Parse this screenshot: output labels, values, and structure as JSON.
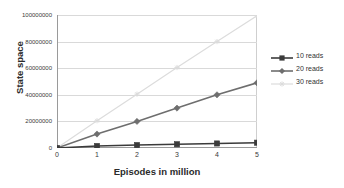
{
  "chart_data": {
    "type": "line",
    "title": "",
    "xlabel": "Episodes in million",
    "ylabel": "State space",
    "x": [
      0,
      1,
      2,
      3,
      4,
      5
    ],
    "xtick_labels": [
      "0",
      "1",
      "2",
      "3",
      "4",
      "5"
    ],
    "ytick_labels": [
      "0",
      "20000000",
      "40000000",
      "60000000",
      "80000000",
      "100000000"
    ],
    "ytick_values": [
      0,
      20000000,
      40000000,
      60000000,
      80000000,
      100000000
    ],
    "xlim": [
      0,
      5
    ],
    "ylim": [
      0,
      100000000
    ],
    "grid": "horizontal",
    "legend_position": "right",
    "series": [
      {
        "name": "10 reads",
        "values": [
          0,
          1500000,
          2200000,
          2800000,
          3400000,
          4000000
        ],
        "color": "#3b3b3b",
        "marker": "square"
      },
      {
        "name": "20 reads",
        "values": [
          0,
          10500000,
          20000000,
          30000000,
          40000000,
          49000000
        ],
        "color": "#6e6e6e",
        "marker": "diamond"
      },
      {
        "name": "30 reads",
        "values": [
          0,
          20500000,
          40500000,
          60500000,
          80000000,
          99500000
        ],
        "color": "#dcdcdc",
        "marker": "asterisk"
      }
    ]
  },
  "legend": {
    "items": [
      {
        "label": "10 reads"
      },
      {
        "label": "20 reads"
      },
      {
        "label": "30 reads"
      }
    ]
  },
  "axes": {
    "y_title": "State space",
    "x_title": "Episodes in million"
  },
  "colors": {
    "series_1": "#3b3b3b",
    "series_2": "#6e6e6e",
    "series_3": "#dcdcdc",
    "grid": "#d9d9d9",
    "axis": "#9a9a9a",
    "plot_border": "#cfcfcf",
    "text": "#333333",
    "background": "#ffffff"
  }
}
